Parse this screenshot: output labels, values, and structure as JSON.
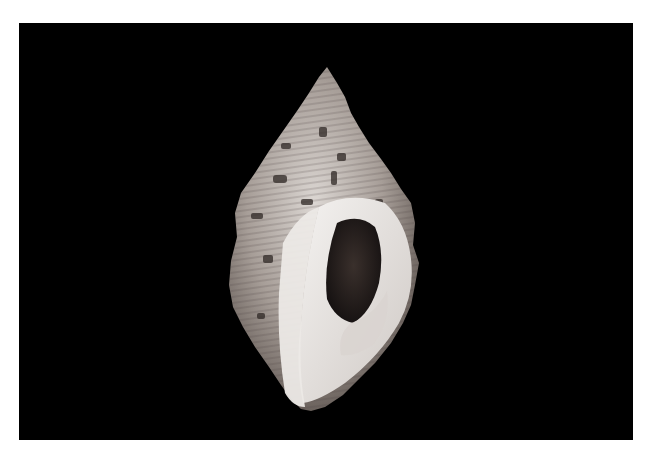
{
  "image": {
    "subject": "Seashell specimen on black background",
    "description": "Photograph of a spiral gastropod shell (conch-like) with banded brown/grey texture and a pearly white aperture, shown against a black backdrop with a white border",
    "background_color": "#000000",
    "border_color": "#ffffff",
    "shell_palette": {
      "light": "#e9e6e3",
      "mid": "#9c928c",
      "dark": "#3b3431",
      "aperture_dark": "#1a1412"
    }
  }
}
